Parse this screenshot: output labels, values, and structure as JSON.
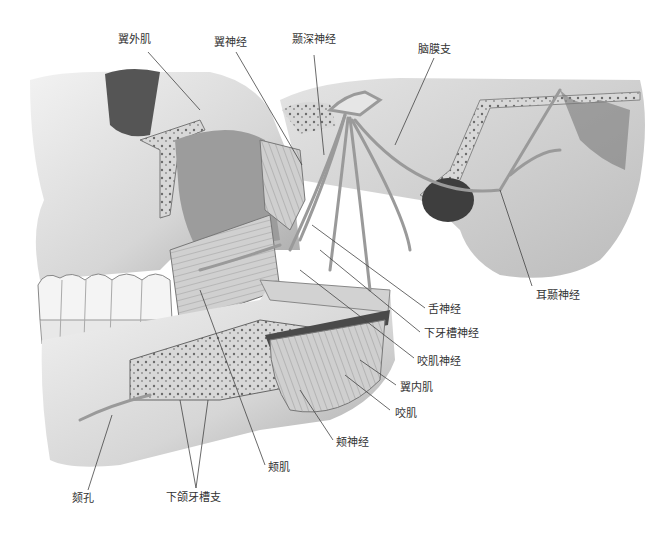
{
  "figure": {
    "colors": {
      "background": "#ffffff",
      "label_text": "#333333",
      "leader_line": "#444444",
      "bone": "#dcdcdc",
      "bone_shadow": "#9a9a9a",
      "marrow": "#b8b8b8",
      "muscle": "#c8c8c8",
      "nerve": "#e6e6e6",
      "dark_muscle": "#4a4a4a"
    }
  },
  "labels": [
    {
      "id": "lateral-pterygoid",
      "text": "翼外肌",
      "x": 118,
      "y": 33
    },
    {
      "id": "pterygoid-nerve",
      "text": "翼神经",
      "x": 214,
      "y": 36
    },
    {
      "id": "deep-temporal-nerve",
      "text": "颞深神经",
      "x": 292,
      "y": 33
    },
    {
      "id": "meningeal-branch",
      "text": "脑膜支",
      "x": 418,
      "y": 43
    },
    {
      "id": "auriculotemporal-nerve",
      "text": "耳颞神经",
      "x": 536,
      "y": 289
    },
    {
      "id": "lingual-nerve",
      "text": "舌神经",
      "x": 428,
      "y": 303
    },
    {
      "id": "inferior-alveolar-nerve",
      "text": "下牙槽神经",
      "x": 424,
      "y": 327
    },
    {
      "id": "masseteric-nerve",
      "text": "咬肌神经",
      "x": 417,
      "y": 355
    },
    {
      "id": "medial-pterygoid",
      "text": "翼内肌",
      "x": 400,
      "y": 381
    },
    {
      "id": "masseter",
      "text": "咬肌",
      "x": 395,
      "y": 407
    },
    {
      "id": "buccal-nerve",
      "text": "颊神经",
      "x": 336,
      "y": 436
    },
    {
      "id": "buccinator",
      "text": "颊肌",
      "x": 268,
      "y": 461
    },
    {
      "id": "mental-foramen",
      "text": "颏孔",
      "x": 72,
      "y": 492
    },
    {
      "id": "inferior-dental-branches",
      "text": "下颌牙槽支",
      "x": 166,
      "y": 491
    }
  ]
}
